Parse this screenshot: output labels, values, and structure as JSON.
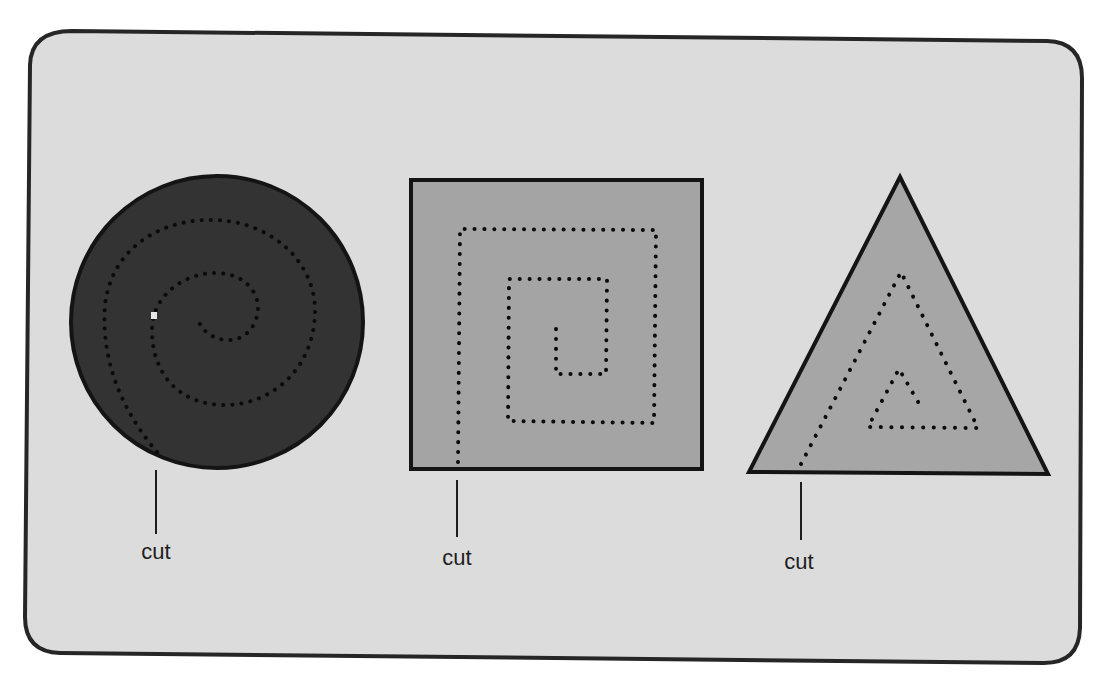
{
  "figure": {
    "panel": {
      "background": "#dcdcdc",
      "border": "#262626"
    },
    "colors": {
      "circle_fill": "#333333",
      "square_fill": "#a4a4a4",
      "triangle_fill": "#a6a6a6",
      "outline": "#141414",
      "dots": "#111111"
    },
    "shapes": [
      {
        "name": "circle",
        "path_shape": "round spiral",
        "label": "cut"
      },
      {
        "name": "square",
        "path_shape": "square spiral",
        "label": "cut"
      },
      {
        "name": "triangle",
        "path_shape": "triangular spiral",
        "label": "cut"
      }
    ]
  }
}
